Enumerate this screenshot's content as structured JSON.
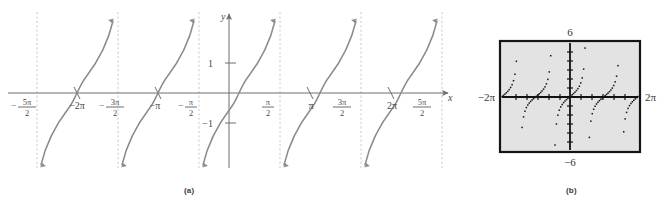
{
  "figure": {
    "panels": [
      {
        "id": "a",
        "caption": "(a)",
        "kind": "hand-drawn-graph"
      },
      {
        "id": "b",
        "caption": "(b)",
        "kind": "calculator-screen"
      }
    ]
  },
  "panel_a": {
    "axis_labels": {
      "x": "x",
      "y": "y"
    },
    "x_ticks": [
      {
        "label_html": "- 5π/2",
        "num": "5π",
        "den": "2",
        "sign": "−",
        "x": 27
      },
      {
        "label_html": "−2π",
        "x": 77
      },
      {
        "label_html": "- 3π/2",
        "num": "3π",
        "den": "2",
        "sign": "−",
        "x": 115
      },
      {
        "label_html": "−π",
        "x": 155
      },
      {
        "label_html": "- π/2",
        "num": "π",
        "den": "2",
        "sign": "−",
        "x": 190
      },
      {
        "label_html": "π/2",
        "num": "π",
        "den": "2",
        "sign": "",
        "x": 268
      },
      {
        "label_html": "π",
        "x": 308
      },
      {
        "label_html": "3π/2",
        "num": "3π",
        "den": "2",
        "sign": "",
        "x": 342
      },
      {
        "label_html": "2π",
        "x": 385
      },
      {
        "label_html": "5π/2",
        "num": "5π",
        "den": "2",
        "sign": "",
        "x": 422
      }
    ],
    "y_ticks": [
      {
        "label": "1",
        "y": 63
      },
      {
        "label": "−1",
        "y": 123
      }
    ],
    "colors": {
      "curve": "#8a8a8a",
      "axis": "#6e6e6e",
      "asymptote": "#c8c8c8",
      "text": "#4a4a4a"
    }
  },
  "panel_b": {
    "screen_labels": {
      "top": "6",
      "bottom": "−6",
      "left": "−2π",
      "right": "2π"
    },
    "colors": {
      "screen_fill": "#e3e3e3",
      "screen_border": "#1a1a1a",
      "axis": "#111111",
      "dots": "#151515",
      "text": "#3a3a3a"
    },
    "window": {
      "xmin": "−2π",
      "xmax": "2π",
      "ymin": "−6",
      "ymax": "6"
    }
  },
  "chart_data": {
    "type": "line",
    "title": "",
    "xlabel": "x",
    "ylabel": "y",
    "function": "y = tan x",
    "xlim": [
      -7.853981634,
      7.853981634
    ],
    "ylim": [
      -6,
      6
    ],
    "grid": false,
    "legend": null,
    "asymptotes_x": [
      -7.853981634,
      -4.71238898,
      -1.570796327,
      1.570796327,
      4.71238898,
      7.853981634
    ],
    "xtick_labels": [
      "-5π/2",
      "-2π",
      "-3π/2",
      "-π",
      "-π/2",
      "π/2",
      "π",
      "3π/2",
      "2π",
      "5π/2"
    ],
    "xtick_values": [
      -7.853981634,
      -6.283185307,
      -4.71238898,
      -3.141592654,
      -1.570796327,
      1.570796327,
      3.141592654,
      4.71238898,
      6.283185307,
      7.853981634
    ],
    "ytick_labels": [
      "1",
      "-1"
    ],
    "ytick_values": [
      1,
      -1
    ],
    "branches": [
      {
        "center": -6.283185307,
        "from": -7.853981634,
        "to": -4.71238898
      },
      {
        "center": -3.141592654,
        "from": -4.71238898,
        "to": -1.570796327
      },
      {
        "center": 0,
        "from": -1.570796327,
        "to": 1.570796327
      },
      {
        "center": 3.141592654,
        "from": 1.570796327,
        "to": 4.71238898
      },
      {
        "center": 6.283185307,
        "from": 4.71238898,
        "to": 7.853981634
      }
    ],
    "panel_b_plot": {
      "type": "scatter",
      "title": "",
      "xlim": [
        -6.283185307,
        6.283185307
      ],
      "ylim": [
        -6,
        6
      ],
      "note": "graphing-calculator dot-mode rendering of y = tan x"
    }
  }
}
